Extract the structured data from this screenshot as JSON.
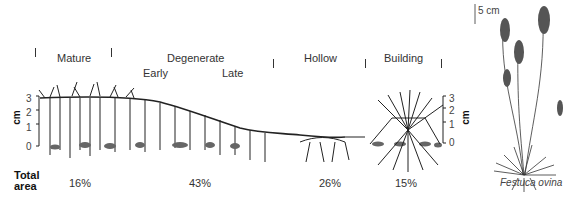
{
  "phases": {
    "mature": "Mature",
    "degenerate": "Degenerate",
    "early": "Early",
    "late": "Late",
    "hollow": "Hollow",
    "building": "Building"
  },
  "axis_left": {
    "unit": "cm",
    "ticks": [
      "3",
      "2",
      "1",
      "0"
    ]
  },
  "axis_right": {
    "unit": "cm",
    "ticks": [
      "3",
      "2",
      "1",
      "0"
    ]
  },
  "total_area": {
    "label_line1": "Total",
    "label_line2": "area",
    "mature": "16%",
    "degenerate": "43%",
    "hollow": "26%",
    "building": "15%"
  },
  "scale_bar": "5 cm",
  "species_caption": "Festuca ovina"
}
